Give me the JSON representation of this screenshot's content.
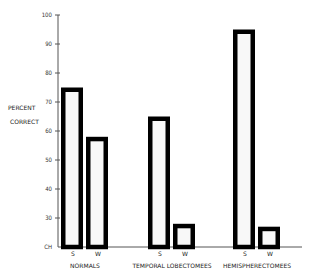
{
  "chart_data": {
    "type": "bar",
    "title": "",
    "xlabel": "",
    "ylabel": "PERCENT CORRECT",
    "ylabel_lines": [
      "PERCENT",
      "CORRECT"
    ],
    "ylim": [
      20,
      100
    ],
    "yticks": [
      {
        "value": 100,
        "label": "100"
      },
      {
        "value": 90,
        "label": "90"
      },
      {
        "value": 80,
        "label": "80"
      },
      {
        "value": 70,
        "label": "70"
      },
      {
        "value": 60,
        "label": "60"
      },
      {
        "value": 50,
        "label": "50"
      },
      {
        "value": 40,
        "label": "40"
      },
      {
        "value": 30,
        "label": "30"
      },
      {
        "value": 20,
        "label": "CH"
      }
    ],
    "grid": false,
    "legend": "none",
    "groups": [
      {
        "name": "NORMALS",
        "bars": [
          {
            "label": "S",
            "value": 75
          },
          {
            "label": "W",
            "value": 58
          }
        ]
      },
      {
        "name": "TEMPORAL LOBECTOMEES",
        "bars": [
          {
            "label": "S",
            "value": 65
          },
          {
            "label": "W",
            "value": 28
          }
        ]
      },
      {
        "name": "HEMISPHERECTOMEES",
        "bars": [
          {
            "label": "S",
            "value": 95
          },
          {
            "label": "W",
            "value": 27
          }
        ]
      }
    ],
    "colors": {
      "bar_fill": "#f8f8f8",
      "bar_stroke": "#000000",
      "axis": "#555555"
    }
  }
}
